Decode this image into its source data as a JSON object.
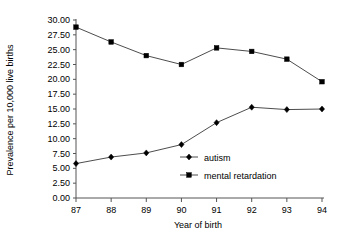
{
  "chart_data": {
    "type": "line",
    "title": "",
    "xlabel": "Year of birth",
    "ylabel": "Prevalence per 10,000 live births",
    "categories": [
      "87",
      "88",
      "89",
      "90",
      "91",
      "92",
      "93",
      "94"
    ],
    "series": [
      {
        "name": "autism",
        "marker": "diamond",
        "values": [
          5.8,
          6.9,
          7.6,
          9.0,
          12.7,
          15.3,
          14.9,
          15.0
        ]
      },
      {
        "name": "mental retardation",
        "marker": "square",
        "values": [
          28.8,
          26.3,
          24.0,
          22.5,
          25.3,
          24.7,
          23.4,
          19.6
        ]
      }
    ],
    "ylim": [
      0,
      30
    ],
    "yticks": [
      "0.00",
      "2.50",
      "5.00",
      "7.50",
      "10.00",
      "12.50",
      "15.00",
      "17.50",
      "20.00",
      "22.50",
      "25.00",
      "27.50",
      "30.00"
    ],
    "ytick_values": [
      0,
      2.5,
      5,
      7.5,
      10,
      12.5,
      15,
      17.5,
      20,
      22.5,
      25,
      27.5,
      30
    ],
    "grid": false,
    "legend_position": "inside-center-right",
    "line_color": "#4d4d4d",
    "marker_color": "#000000",
    "axis_color": "#555555"
  }
}
